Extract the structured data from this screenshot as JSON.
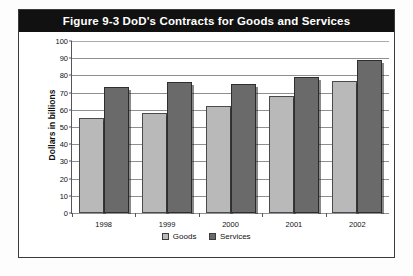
{
  "figure": {
    "title": "Figure 9-3  DoD's Contracts for Goods and Services"
  },
  "legend": {
    "position": "bottom-center",
    "items": [
      {
        "label": "Goods",
        "color": "#b9b9b9",
        "icon": "legend-swatch"
      },
      {
        "label": "Services",
        "color": "#6a6a6a",
        "icon": "legend-swatch"
      }
    ]
  },
  "chart_data": {
    "type": "bar",
    "title": "Figure 9-3  DoD's Contracts for Goods and Services",
    "xlabel": "",
    "ylabel": "Dollars in billions",
    "categories": [
      "1998",
      "1999",
      "2000",
      "2001",
      "2002"
    ],
    "series": [
      {
        "name": "Goods",
        "color": "#b9b9b9",
        "values": [
          55,
          58,
          62,
          68,
          77
        ]
      },
      {
        "name": "Services",
        "color": "#6a6a6a",
        "values": [
          73,
          76,
          75,
          79,
          89
        ]
      }
    ],
    "ylim": [
      0,
      100
    ],
    "yticks": [
      0,
      10,
      20,
      30,
      40,
      50,
      60,
      70,
      80,
      90,
      100
    ],
    "ytick_labels": [
      "0",
      "10",
      "20",
      "30",
      "40",
      "50",
      "60",
      "70",
      "80",
      "90",
      "100"
    ],
    "grid": true,
    "legend_position": "bottom-center"
  },
  "colors": {
    "title_bar_bg": "#111111",
    "title_text": "#ffffff",
    "frame_border": "#3a3a3a",
    "grid": "#8d8f93",
    "axis": "#55565a",
    "background": "#ffffff"
  }
}
